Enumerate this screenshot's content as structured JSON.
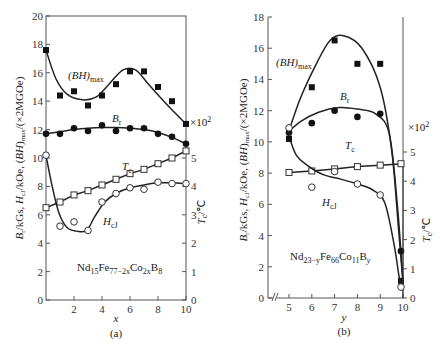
{
  "chart_data": [
    {
      "id": "a",
      "type": "line",
      "caption": "(a)",
      "composition": "Nd15Fe77-2xCo2xB8",
      "xlabel": "x",
      "ylabel_left": "Br/kGs, HcJ/kOe, (BH)max/(×2MGOe)",
      "ylabel_right": "Tc/℃",
      "right_axis_multiplier": "×10²",
      "xlim": [
        0,
        10
      ],
      "ylim_left": [
        0,
        20
      ],
      "ylim_right": [
        0,
        5
      ],
      "xticks": [
        2,
        4,
        6,
        8,
        10
      ],
      "yticks_left": [
        0,
        2,
        4,
        6,
        8,
        10,
        12,
        14,
        16,
        18,
        20
      ],
      "yticks_right": [
        0,
        1,
        2,
        3,
        4,
        5
      ],
      "series": [
        {
          "name": "(BH)max",
          "marker": "filled-square",
          "axis": "left",
          "x": [
            0,
            1,
            2,
            3,
            4,
            5,
            6,
            7,
            8,
            9,
            10
          ],
          "values": [
            17.6,
            14.4,
            14.7,
            13.7,
            14.4,
            15.2,
            16.1,
            16.1,
            15.0,
            14.0,
            12.4
          ]
        },
        {
          "name": "Br",
          "marker": "filled-circle",
          "axis": "left",
          "x": [
            0,
            1,
            2,
            3,
            4,
            5,
            6,
            7,
            8,
            9,
            10
          ],
          "values": [
            11.7,
            11.7,
            12.1,
            11.9,
            12.3,
            11.9,
            12.1,
            12.1,
            11.7,
            11.5,
            11.0
          ]
        },
        {
          "name": "Tc",
          "marker": "open-square",
          "axis": "right",
          "x": [
            0,
            1,
            2,
            3,
            4,
            5,
            6,
            7,
            8,
            9,
            10
          ],
          "values": [
            3.25,
            3.45,
            3.7,
            3.85,
            4.05,
            4.25,
            4.45,
            4.6,
            4.8,
            5.0,
            5.25
          ]
        },
        {
          "name": "HcJ",
          "marker": "open-circle",
          "axis": "left",
          "x": [
            0,
            1,
            2,
            3,
            4,
            5,
            6,
            7,
            8,
            9,
            10
          ],
          "values": [
            10.2,
            5.2,
            5.5,
            4.9,
            6.9,
            7.5,
            7.9,
            7.8,
            8.3,
            8.2,
            8.2
          ]
        }
      ]
    },
    {
      "id": "b",
      "type": "line",
      "caption": "(b)",
      "composition": "Nd23-yFe66Co11By",
      "xlabel": "y",
      "ylabel_left": "Br/kGs, HcJ/kOe, (BH)max/(×2MGOe)",
      "ylabel_right": "Tc/℃",
      "right_axis_multiplier": "×10²",
      "xlim": [
        4.3,
        10
      ],
      "axis_break": true,
      "ylim_left": [
        0,
        18
      ],
      "ylim_right": [
        0,
        5
      ],
      "xticks": [
        5,
        6,
        7,
        8,
        9,
        10
      ],
      "yticks_left": [
        0,
        2,
        4,
        6,
        8,
        10,
        12,
        14,
        16,
        18
      ],
      "yticks_right": [
        0,
        1,
        2,
        3,
        4,
        5
      ],
      "series": [
        {
          "name": "(BH)max",
          "marker": "filled-square",
          "axis": "left",
          "x": [
            5,
            6,
            7,
            8,
            9,
            10
          ],
          "values": [
            10.2,
            13.5,
            16.5,
            15.0,
            15.0,
            1.1
          ]
        },
        {
          "name": "Br",
          "marker": "filled-circle",
          "axis": "left",
          "x": [
            5,
            6,
            7,
            8,
            9,
            10
          ],
          "values": [
            10.6,
            11.2,
            12.0,
            11.6,
            11.8,
            3.0
          ]
        },
        {
          "name": "Tc",
          "marker": "open-square",
          "axis": "right",
          "x": [
            5,
            6,
            7,
            8,
            9,
            10
          ],
          "values": [
            4.3,
            4.35,
            4.42,
            4.5,
            4.55,
            4.6
          ]
        },
        {
          "name": "HcJ",
          "marker": "open-circle",
          "axis": "left",
          "x": [
            5,
            6,
            7,
            8,
            9,
            10
          ],
          "values": [
            10.9,
            7.1,
            8.1,
            7.3,
            6.6,
            0.7
          ]
        }
      ]
    }
  ],
  "labels": {
    "a": {
      "bh": "(BH)",
      "bh_sub": "max",
      "br": "B",
      "br_sub": "r",
      "tc": "T",
      "tc_sub": "c",
      "hcj": "H",
      "hcj_sub": "cJ",
      "mult": "×10",
      "mult_sup": "2",
      "comp": [
        "Nd",
        "15",
        "Fe",
        "77−2x",
        "Co",
        "2x",
        "B",
        "8"
      ],
      "xlabel": "x",
      "caption": "(a)",
      "yl": "B",
      "yl2": "/kGs, H",
      "yl3": "/kOe, (BH)",
      "yl4": "/(×2MGOe)",
      "yr": "T",
      "yr2": "/℃"
    },
    "b": {
      "bh": "(BH)",
      "bh_sub": "max",
      "br": "B",
      "br_sub": "r",
      "tc": "T",
      "tc_sub": "c",
      "hcj": "H",
      "hcj_sub": "cJ",
      "mult": "×10",
      "mult_sup": "2",
      "comp": [
        "Nd",
        "23−y",
        "Fe",
        "66",
        "Co",
        "11",
        "B",
        "y"
      ],
      "xlabel": "y",
      "caption": "(b)"
    }
  }
}
